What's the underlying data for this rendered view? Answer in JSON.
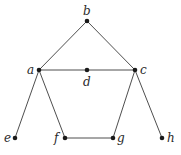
{
  "graph": {
    "nodes": [
      {
        "id": "a",
        "label": "a",
        "x": 39,
        "y": 70,
        "lx": 27,
        "ly": 74
      },
      {
        "id": "b",
        "label": "b",
        "x": 87,
        "y": 21,
        "lx": 83,
        "ly": 15
      },
      {
        "id": "c",
        "label": "c",
        "x": 135,
        "y": 70,
        "lx": 140,
        "ly": 74
      },
      {
        "id": "d",
        "label": "d",
        "x": 87,
        "y": 70,
        "lx": 83,
        "ly": 86
      },
      {
        "id": "e",
        "label": "e",
        "x": 15,
        "y": 138,
        "lx": 4,
        "ly": 142
      },
      {
        "id": "f",
        "label": "f",
        "x": 65,
        "y": 138,
        "lx": 54,
        "ly": 142
      },
      {
        "id": "g",
        "label": "g",
        "x": 113,
        "y": 138,
        "lx": 117,
        "ly": 142
      },
      {
        "id": "h",
        "label": "h",
        "x": 162,
        "y": 138,
        "lx": 167,
        "ly": 142
      }
    ],
    "edges": [
      [
        "b",
        "a"
      ],
      [
        "b",
        "c"
      ],
      [
        "a",
        "d"
      ],
      [
        "d",
        "c"
      ],
      [
        "a",
        "e"
      ],
      [
        "a",
        "f"
      ],
      [
        "f",
        "g"
      ],
      [
        "g",
        "c"
      ],
      [
        "c",
        "h"
      ]
    ]
  }
}
